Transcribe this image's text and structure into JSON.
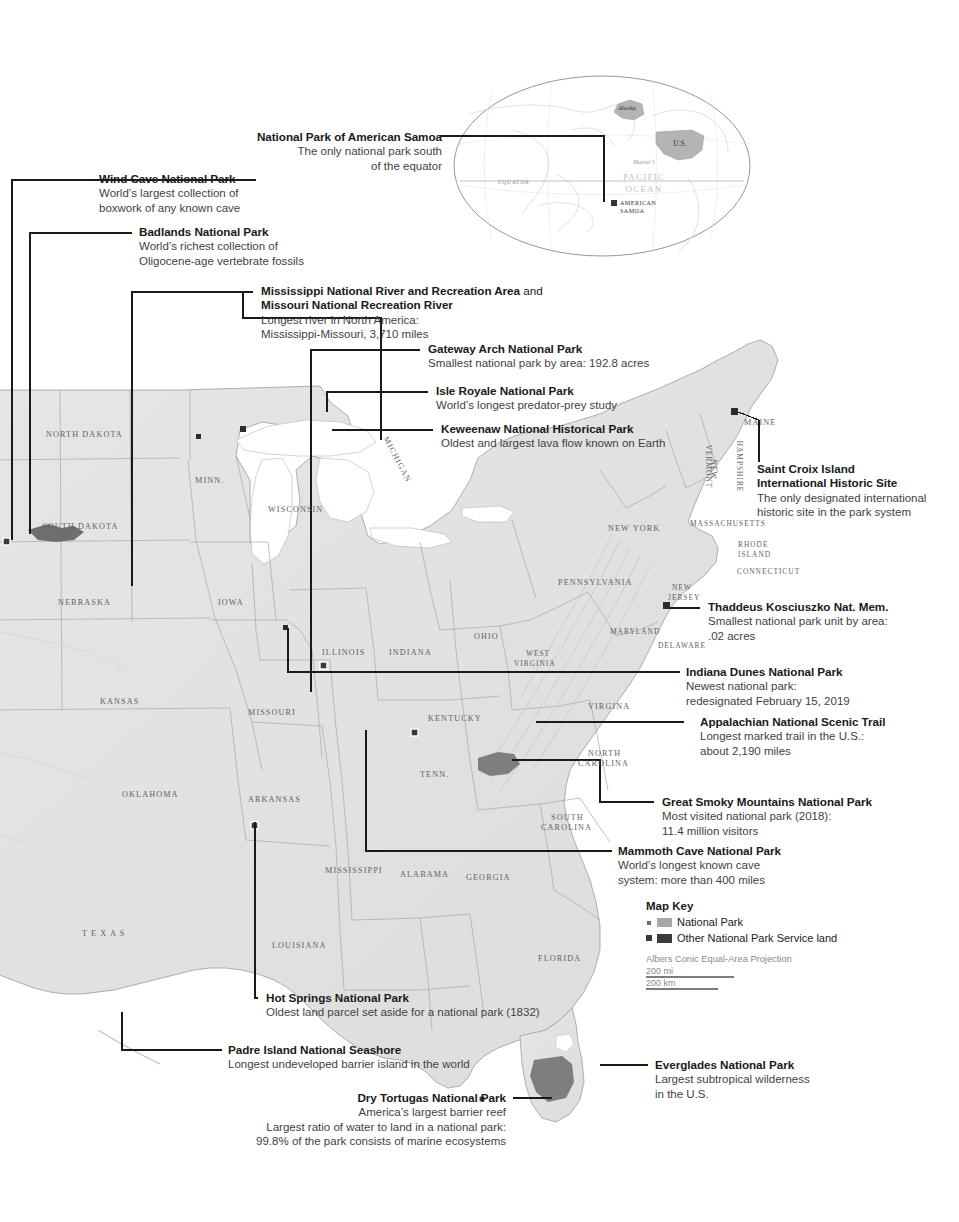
{
  "inset": {
    "labels": [
      {
        "name": "alaska",
        "text": "Alaska"
      },
      {
        "name": "us",
        "text": "U.S."
      },
      {
        "name": "hawaii",
        "text": "Hawai‘i"
      },
      {
        "name": "pacific",
        "text": "PACIFIC"
      },
      {
        "name": "ocean",
        "text": "OCEAN"
      },
      {
        "name": "equator",
        "text": "EQUATOR"
      },
      {
        "name": "american-samoa-1",
        "text": "AMERICAN"
      },
      {
        "name": "american-samoa-2",
        "text": "SAMOA"
      }
    ]
  },
  "callouts": [
    {
      "id": "national-park-of-american-samoa",
      "title": "National Park of American Samoa",
      "lines": [
        "The only national park south",
        "of the equator"
      ]
    },
    {
      "id": "wind-cave-national-park",
      "title": "Wind Cave National Park",
      "lines": [
        "World’s largest collection of",
        "boxwork of any known cave"
      ]
    },
    {
      "id": "badlands-national-park",
      "title": "Badlands National Park",
      "lines": [
        "World’s richest collection of",
        "Oligocene-age vertebrate fossils"
      ]
    },
    {
      "id": "mississippi-missouri-rivers",
      "title": "Mississippi National River and Recreation Area",
      "title_tail": " and",
      "title2": "Missouri National Recreation River",
      "lines": [
        "Longest river in North America:",
        "Mississippi-Missouri, 3,710 miles"
      ]
    },
    {
      "id": "gateway-arch-national-park",
      "title": "Gateway Arch National Park",
      "lines": [
        "Smallest national park by area: 192.8 acres"
      ]
    },
    {
      "id": "isle-royale-national-park",
      "title": "Isle Royale National Park",
      "lines": [
        "World’s longest predator-prey study"
      ]
    },
    {
      "id": "keweenaw-national-historical-park",
      "title": "Keweenaw National Historical Park",
      "lines": [
        "Oldest and largest lava flow known on Earth"
      ]
    },
    {
      "id": "saint-croix-island",
      "title": "Saint Croix Island",
      "title2": "International Historic Site",
      "lines": [
        "The only designated international",
        "historic site in the park system"
      ]
    },
    {
      "id": "thaddeus-kosciuszko",
      "title": "Thaddeus Kosciuszko Nat. Mem.",
      "lines": [
        "Smallest national park unit by area:",
        ".02 acres"
      ]
    },
    {
      "id": "indiana-dunes-national-park",
      "title": "Indiana Dunes National Park",
      "lines": [
        "Newest national park:",
        "redesignated February 15, 2019"
      ]
    },
    {
      "id": "appalachian-trail",
      "title": "Appalachian National Scenic Trail",
      "lines": [
        "Longest marked trail in the U.S.:",
        "about 2,190 miles"
      ]
    },
    {
      "id": "great-smoky-mountains",
      "title": "Great Smoky Mountains National Park",
      "lines": [
        "Most visited national park (2018):",
        "11.4 million visitors"
      ]
    },
    {
      "id": "mammoth-cave-national-park",
      "title": "Mammoth Cave National Park",
      "lines": [
        "World’s longest known cave",
        "system: more than 400 miles"
      ]
    },
    {
      "id": "hot-springs-national-park",
      "title": "Hot Springs National Park",
      "lines": [
        "Oldest land parcel set aside for a national park (1832)"
      ]
    },
    {
      "id": "padre-island-national-seashore",
      "title": "Padre Island National Seashore",
      "lines": [
        "Longest undeveloped barrier island in the world"
      ]
    },
    {
      "id": "everglades-national-park",
      "title": "Everglades National Park",
      "lines": [
        "Largest subtropical wilderness",
        "in the U.S."
      ]
    },
    {
      "id": "dry-tortugas-national-park",
      "title": "Dry Tortugas National Park",
      "lines": [
        "America’s largest barrier reef",
        "Largest ratio of water to land in a national park:",
        "99.8% of the park consists of marine ecosystems"
      ]
    }
  ],
  "map_key": {
    "title": "Map Key",
    "entries": [
      {
        "label": "National Park",
        "swatch": "#a8a8a8"
      },
      {
        "label": "Other National Park Service land",
        "swatch": "#3a3a3a"
      }
    ],
    "projection": "Albers Conic Equal-Area Projection",
    "scale_mi": "200 mi",
    "scale_km": "200 km"
  },
  "state_labels": [
    {
      "text": "NORTH DAKOTA",
      "x": 46,
      "y": 430,
      "size": "n"
    },
    {
      "text": "SOUTH DAKOTA",
      "x": 42,
      "y": 522,
      "size": "n"
    },
    {
      "text": "NEBRASKA",
      "x": 58,
      "y": 598,
      "size": "n"
    },
    {
      "text": "KANSAS",
      "x": 100,
      "y": 697,
      "size": "n"
    },
    {
      "text": "OKLAHOMA",
      "x": 122,
      "y": 790,
      "size": "n"
    },
    {
      "text": "T E X A S",
      "x": 82,
      "y": 929,
      "size": "n"
    },
    {
      "text": "MINN.",
      "x": 195,
      "y": 476,
      "size": "n"
    },
    {
      "text": "WISCONSIN",
      "x": 268,
      "y": 505,
      "size": "n"
    },
    {
      "text": "IOWA",
      "x": 218,
      "y": 598,
      "size": "n"
    },
    {
      "text": "MISSOURI",
      "x": 248,
      "y": 708,
      "size": "n"
    },
    {
      "text": "ARKANSAS",
      "x": 248,
      "y": 795,
      "size": "n"
    },
    {
      "text": "LOUISIANA",
      "x": 272,
      "y": 941,
      "size": "n"
    },
    {
      "text": "MISSISSIPPI",
      "x": 325,
      "y": 866,
      "size": "n"
    },
    {
      "text": "ALABAMA",
      "x": 400,
      "y": 870,
      "size": "n"
    },
    {
      "text": "GEORGIA",
      "x": 466,
      "y": 873,
      "size": "n"
    },
    {
      "text": "FLORIDA",
      "x": 538,
      "y": 954,
      "size": "n"
    },
    {
      "text": "ILLINOIS",
      "x": 322,
      "y": 648,
      "size": "n"
    },
    {
      "text": "INDIANA",
      "x": 389,
      "y": 648,
      "size": "n"
    },
    {
      "text": "OHIO",
      "x": 474,
      "y": 632,
      "size": "n"
    },
    {
      "text": "KENTUCKY",
      "x": 428,
      "y": 714,
      "size": "n"
    },
    {
      "text": "TENN.",
      "x": 420,
      "y": 770,
      "size": "n"
    },
    {
      "text": "WEST",
      "x": 526,
      "y": 649,
      "size": "sm"
    },
    {
      "text": "VIRGINIA",
      "x": 514,
      "y": 659,
      "size": "sm"
    },
    {
      "text": "VIRGINA",
      "x": 588,
      "y": 702,
      "size": "n"
    },
    {
      "text": "NORTH",
      "x": 588,
      "y": 749,
      "size": "n"
    },
    {
      "text": "CAROLINA",
      "x": 578,
      "y": 759,
      "size": "n"
    },
    {
      "text": "SOUTH",
      "x": 551,
      "y": 813,
      "size": "n"
    },
    {
      "text": "CAROLINA",
      "x": 541,
      "y": 823,
      "size": "n"
    },
    {
      "text": "MARYLAND",
      "x": 610,
      "y": 627,
      "size": "sm"
    },
    {
      "text": "DELAWARE",
      "x": 658,
      "y": 641,
      "size": "sm"
    },
    {
      "text": "PENNSYLVANIA",
      "x": 558,
      "y": 578,
      "size": "n"
    },
    {
      "text": "NEW YORK",
      "x": 608,
      "y": 524,
      "size": "n"
    },
    {
      "text": "MASSACHUSETTS",
      "x": 690,
      "y": 519,
      "size": "sm"
    },
    {
      "text": "RHODE",
      "x": 738,
      "y": 540,
      "size": "sm"
    },
    {
      "text": "ISLAND",
      "x": 738,
      "y": 550,
      "size": "sm"
    },
    {
      "text": "CONNECTICUT",
      "x": 737,
      "y": 567,
      "size": "sm"
    },
    {
      "text": "NEW",
      "x": 672,
      "y": 583,
      "size": "sm"
    },
    {
      "text": "JERSEY",
      "x": 668,
      "y": 593,
      "size": "sm"
    },
    {
      "text": "MAINE",
      "x": 744,
      "y": 418,
      "size": "n"
    },
    {
      "text": "MICHIGAN",
      "x": 372,
      "y": 455,
      "size": "n"
    },
    {
      "text": "VERMONT",
      "x": 687,
      "y": 462,
      "size": "sm"
    },
    {
      "text": "NEW",
      "x": 704,
      "y": 465,
      "size": "sm"
    },
    {
      "text": "HAMPSHIRE",
      "x": 714,
      "y": 462,
      "size": "sm"
    }
  ],
  "colors": {
    "land": "#e2e2e2",
    "land_stroke": "#9a9a9a",
    "water": "#ffffff",
    "park": "#a8a8a8",
    "other_park": "#3a3a3a",
    "leader": "#1a1a1a",
    "text": "#231f20",
    "subtext": "#3f3f3f",
    "state_label": "#5f5f5f"
  }
}
